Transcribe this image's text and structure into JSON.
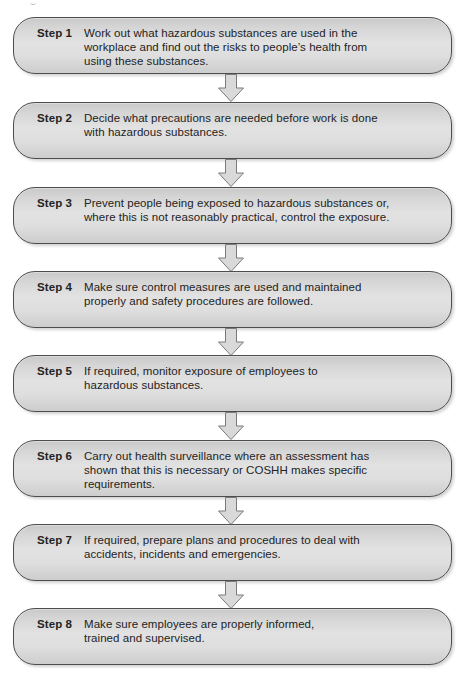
{
  "diagram": {
    "type": "flowchart",
    "direction": "top-to-bottom",
    "colors": {
      "box_fill_top": "#c9c9c9",
      "box_fill_mid": "#e2e2e2",
      "box_border": "#4d4d4d",
      "arrow_fill": "#d9d9d9",
      "arrow_stroke": "#7a7a7a",
      "text": "#232323"
    },
    "steps": [
      {
        "label": "Step 1",
        "lines": [
          "Work out what hazardous substances are used in the",
          "workplace and find out the risks to people’s health from",
          "using these substances."
        ]
      },
      {
        "label": "Step 2",
        "lines": [
          "Decide what precautions are needed before work is done",
          "with hazardous substances."
        ]
      },
      {
        "label": "Step 3",
        "lines": [
          "Prevent people being exposed to hazardous substances or,",
          "where this is not reasonably practical, control the exposure."
        ]
      },
      {
        "label": "Step 4",
        "lines": [
          "Make sure control measures are used and maintained",
          "properly and safety procedures are followed."
        ]
      },
      {
        "label": "Step 5",
        "lines": [
          "If required, monitor exposure of employees to",
          "hazardous substances."
        ]
      },
      {
        "label": "Step 6",
        "lines": [
          "Carry out health surveillance where an assessment has",
          "shown that this is necessary or COSHH makes specific",
          "requirements."
        ]
      },
      {
        "label": "Step 7",
        "lines": [
          "If required, prepare plans and procedures to deal with",
          "accidents, incidents and emergencies."
        ]
      },
      {
        "label": "Step 8",
        "lines": [
          "Make sure employees are properly informed,",
          "trained and supervised."
        ]
      }
    ],
    "arrows": [
      {
        "from": "Step 1",
        "to": "Step 2",
        "icon": "down-arrow-icon"
      },
      {
        "from": "Step 2",
        "to": "Step 3",
        "icon": "down-arrow-icon"
      },
      {
        "from": "Step 3",
        "to": "Step 4",
        "icon": "down-arrow-icon"
      },
      {
        "from": "Step 4",
        "to": "Step 5",
        "icon": "down-arrow-icon"
      },
      {
        "from": "Step 5",
        "to": "Step 6",
        "icon": "down-arrow-icon"
      },
      {
        "from": "Step 6",
        "to": "Step 7",
        "icon": "down-arrow-icon"
      },
      {
        "from": "Step 7",
        "to": "Step 8",
        "icon": "down-arrow-icon"
      }
    ]
  }
}
